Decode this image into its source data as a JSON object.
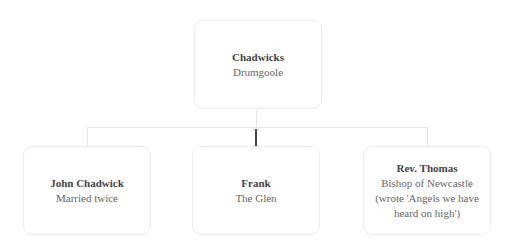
{
  "chart": {
    "root": {
      "name": "Chadwicks",
      "lines": [
        "Drumgoole"
      ]
    },
    "children": [
      {
        "name": "John Chadwick",
        "lines": [
          "Married twice"
        ]
      },
      {
        "name": "Frank",
        "lines": [
          "The Glen"
        ]
      },
      {
        "name": "Rev. Thomas",
        "lines": [
          "Bishop of Newcastle",
          "(wrote 'Angels we have",
          "heard on high')"
        ]
      }
    ]
  },
  "colors": {
    "border": "#ececec",
    "connector": "#e6e6e6",
    "selected_connector": "#444444"
  }
}
